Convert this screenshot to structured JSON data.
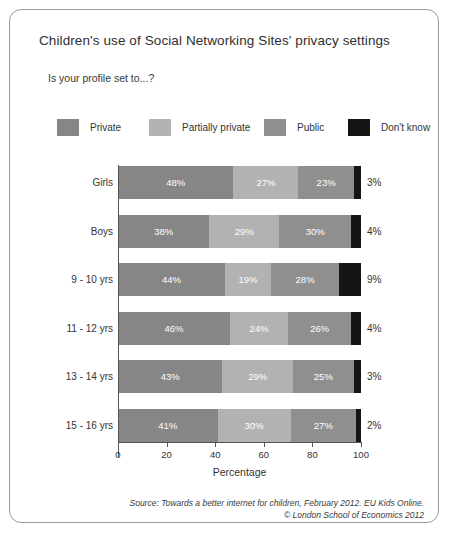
{
  "chart_data": {
    "type": "bar",
    "subtype": "stacked-horizontal-100",
    "title": "Children's use of Social Networking Sites' privacy settings",
    "subtitle": "Is your profile set to...?",
    "xlabel": "Percentage",
    "ylabel": "",
    "xlim": [
      0,
      100
    ],
    "xticks": [
      0,
      20,
      40,
      60,
      80,
      100
    ],
    "xtick_labels": [
      "0",
      "20",
      "40",
      "60",
      "80",
      "100"
    ],
    "grid": false,
    "legend_position": "top",
    "categories": [
      "Girls",
      "Boys",
      "9 - 10 yrs",
      "11 - 12 yrs",
      "13 - 14 yrs",
      "15 - 16 yrs"
    ],
    "series": [
      {
        "name": "Private",
        "color": "#868686",
        "values": [
          48,
          38,
          44,
          46,
          43,
          41
        ],
        "labels": [
          "48%",
          "38%",
          "44%",
          "46%",
          "43%",
          "41%"
        ]
      },
      {
        "name": "Partially private",
        "color": "#b2b2b2",
        "values": [
          27,
          29,
          19,
          24,
          29,
          30
        ],
        "labels": [
          "27%",
          "29%",
          "19%",
          "24%",
          "29%",
          "30%"
        ]
      },
      {
        "name": "Public",
        "color": "#8f8f8f",
        "values": [
          23,
          30,
          28,
          26,
          25,
          27
        ],
        "labels": [
          "23%",
          "30%",
          "28%",
          "26%",
          "25%",
          "27%"
        ]
      },
      {
        "name": "Don't know",
        "color": "#151515",
        "values": [
          3,
          4,
          9,
          4,
          3,
          2
        ],
        "labels": [
          "3%",
          "4%",
          "9%",
          "4%",
          "3%",
          "2%"
        ],
        "labels_outside": true
      }
    ],
    "annotations": [
      "Source: Towards a better internet for children, February 2012. EU Kids Online.",
      "© London School of Economics 2012"
    ]
  },
  "legend": {
    "items": [
      {
        "label": "Private",
        "color": "#868686"
      },
      {
        "label": "Partially private",
        "color": "#b2b2b2"
      },
      {
        "label": "Public",
        "color": "#8f8f8f"
      },
      {
        "label": "Don't know",
        "color": "#151515"
      }
    ]
  },
  "source": {
    "line1": "Source: Towards a better internet for children, February 2012. EU Kids Online.",
    "line2": "© London School of Economics 2012"
  }
}
